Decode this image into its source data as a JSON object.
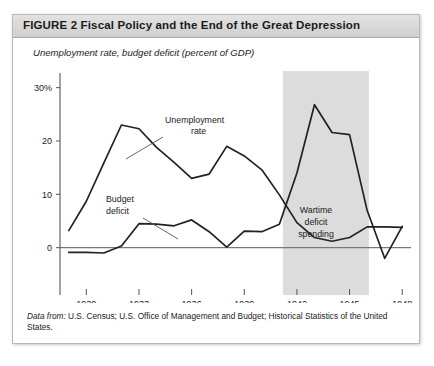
{
  "figure": {
    "label": "FIGURE",
    "number": "2",
    "title": "Fiscal Policy and the End of the Great Depression",
    "title_full": "FIGURE  2  Fiscal Policy and the End of the Great Depression",
    "subtitle": "Unemployment rate, budget deficit (percent of GDP)",
    "source_prefix": "Data from:",
    "source_text": "U.S. Census; U.S. Office of Management and Budget; Historical Statistics of the United States."
  },
  "chart_data": {
    "type": "line",
    "title": "Fiscal Policy and the End of the Great Depression",
    "subtitle": "Unemployment rate, budget deficit (percent of GDP)",
    "xlabel": "",
    "ylabel": "Unemployment rate, budget deficit (percent of GDP)",
    "xlim": [
      1928.5,
      1948.5
    ],
    "ylim": [
      -4,
      32
    ],
    "yticks": [
      0,
      10,
      20,
      30
    ],
    "ytick_labels": [
      "0",
      "10",
      "20",
      "30%"
    ],
    "xticks": [
      1930,
      1933,
      1936,
      1939,
      1942,
      1945,
      1948
    ],
    "xtick_labels": [
      "1930",
      "1933",
      "1936",
      "1939",
      "1942",
      "1945",
      "1948"
    ],
    "grid": false,
    "legend": "none",
    "zero_line": true,
    "x": [
      1929,
      1930,
      1931,
      1932,
      1933,
      1934,
      1935,
      1936,
      1937,
      1938,
      1939,
      1940,
      1941,
      1942,
      1943,
      1944,
      1945,
      1946,
      1947,
      1948
    ],
    "series": [
      {
        "name": "Unemployment rate",
        "values": [
          3.2,
          8.7,
          15.9,
          23.0,
          22.3,
          18.8,
          16.0,
          13.0,
          13.8,
          19.0,
          17.2,
          14.6,
          9.9,
          4.7,
          1.9,
          1.2,
          1.9,
          3.9,
          3.9,
          3.8
        ]
      },
      {
        "name": "Budget deficit",
        "values": [
          -0.9,
          -0.9,
          -1.0,
          0.3,
          4.5,
          4.4,
          4.1,
          5.2,
          3.0,
          0.1,
          3.1,
          3.0,
          4.4,
          14.0,
          26.8,
          21.6,
          21.2,
          7.0,
          -2.0,
          4.0
        ]
      }
    ],
    "annotations": [
      {
        "name": "unemployment-rate",
        "text_lines": [
          "Unemployment",
          "rate"
        ],
        "target_series": "Unemployment rate"
      },
      {
        "name": "budget-deficit",
        "text_lines": [
          "Budget",
          "deficit"
        ],
        "target_series": "Budget deficit"
      },
      {
        "name": "wartime-deficit-spending",
        "text_lines": [
          "Wartime",
          "deficit",
          "spending"
        ],
        "target_series": "Budget deficit"
      }
    ],
    "shaded_region": {
      "name": "Wartime deficit spending",
      "x_start": 1941.2,
      "x_end": 1946.1,
      "color": "#dcdcdc"
    },
    "line_color": "#222222"
  }
}
